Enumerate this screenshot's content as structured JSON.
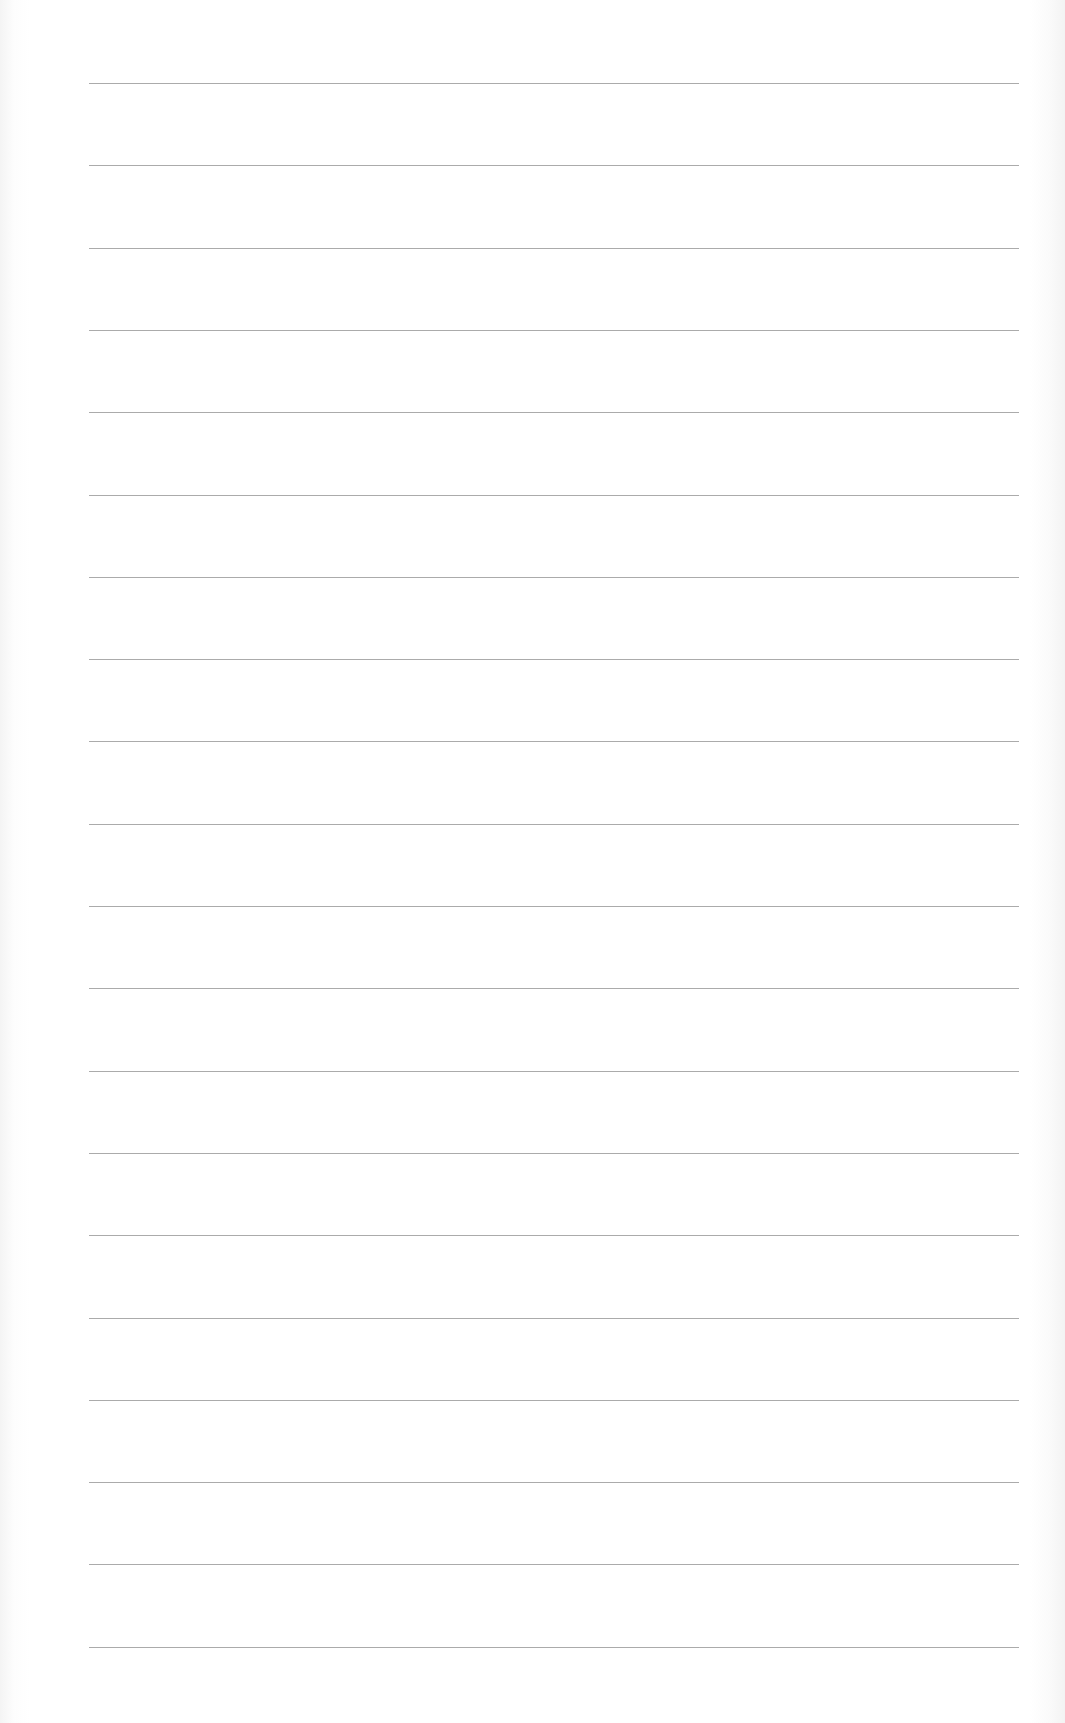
{
  "document": {
    "type": "blank lined paper",
    "line_color": "#9c9c9c",
    "background_color": "#ffffff",
    "lines": {
      "count": 20,
      "left": 89,
      "right": 1019,
      "first_y": 83,
      "spacing": 82.3
    }
  }
}
